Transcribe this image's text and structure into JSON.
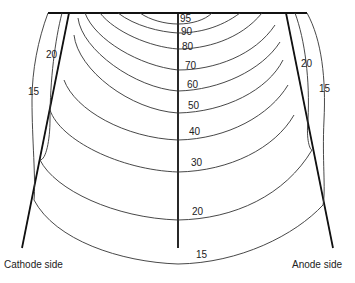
{
  "diagram": {
    "type": "isodose-heel-effect",
    "isodose_labels": {
      "95": "95",
      "90": "90",
      "80": "80",
      "70": "70",
      "60": "60",
      "50": "50",
      "40": "40",
      "30": "30",
      "20_center": "20",
      "15_center": "15",
      "20_left": "20",
      "15_left": "15",
      "20_right": "20",
      "15_right": "15"
    },
    "side_labels": {
      "cathode": "Cathode side",
      "anode": "Anode side"
    }
  }
}
